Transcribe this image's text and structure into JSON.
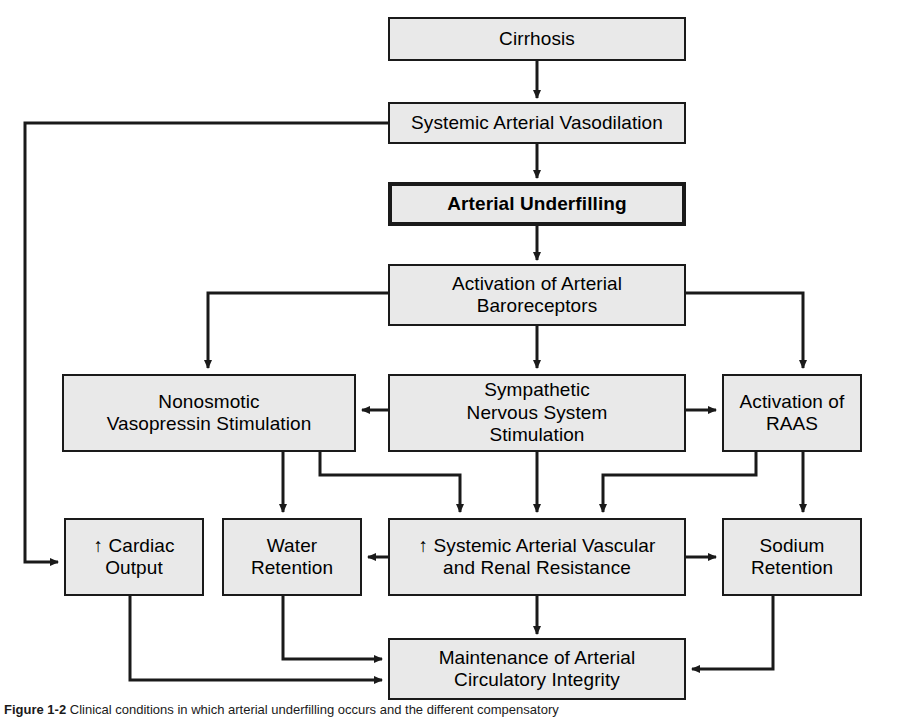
{
  "figure": {
    "caption_number": "Figure 1-2",
    "caption_text": "Clinical conditions in which arterial underfilling occurs and the different compensatory",
    "box_fill": "#e9e9e9",
    "box_stroke": "#1a1a1a",
    "background": "#ffffff"
  },
  "nodes": [
    {
      "id": "cirrhosis",
      "label": "Cirrhosis",
      "x": 388,
      "y": 17,
      "w": 298,
      "h": 44,
      "emphasis": false
    },
    {
      "id": "systemic-arterial-vasodilation",
      "label": "Systemic Arterial Vasodilation",
      "x": 388,
      "y": 102,
      "w": 298,
      "h": 42,
      "emphasis": false
    },
    {
      "id": "arterial-underfilling",
      "label": "Arterial Underfilling",
      "x": 388,
      "y": 182,
      "w": 298,
      "h": 44,
      "emphasis": true
    },
    {
      "id": "activation-of-arterial-baroreceptors",
      "label": "Activation of Arterial\nBaroreceptors",
      "x": 388,
      "y": 264,
      "w": 298,
      "h": 62,
      "emphasis": false
    },
    {
      "id": "nonosmotic-vasopressin-stimulation",
      "label": "Nonosmotic\nVasopressin Stimulation",
      "x": 62,
      "y": 374,
      "w": 294,
      "h": 78,
      "emphasis": false
    },
    {
      "id": "sympathetic-nervous-system-stimulation",
      "label": "Sympathetic\nNervous System\nStimulation",
      "x": 388,
      "y": 374,
      "w": 298,
      "h": 78,
      "emphasis": false
    },
    {
      "id": "activation-of-raas",
      "label": "Activation of\nRAAS",
      "x": 722,
      "y": 374,
      "w": 140,
      "h": 78,
      "emphasis": false
    },
    {
      "id": "cardiac-output",
      "label": "↑ Cardiac\nOutput",
      "x": 64,
      "y": 518,
      "w": 140,
      "h": 78,
      "emphasis": false
    },
    {
      "id": "water-retention",
      "label": "Water\nRetention",
      "x": 222,
      "y": 518,
      "w": 140,
      "h": 78,
      "emphasis": false
    },
    {
      "id": "systemic-arterial-vascular-renal-resistance",
      "label": "↑ Systemic Arterial Vascular\nand Renal Resistance",
      "x": 388,
      "y": 518,
      "w": 298,
      "h": 78,
      "emphasis": false
    },
    {
      "id": "sodium-retention",
      "label": "Sodium\nRetention",
      "x": 722,
      "y": 518,
      "w": 140,
      "h": 78,
      "emphasis": false
    },
    {
      "id": "maintenance-of-arterial-circulatory-integrity",
      "label": "Maintenance of Arterial\nCirculatory Integrity",
      "x": 388,
      "y": 638,
      "w": 298,
      "h": 62,
      "emphasis": false
    }
  ],
  "edges": [
    {
      "id": "cirrhosis-to-vasodilation",
      "from": "cirrhosis",
      "to": "systemic-arterial-vasodilation",
      "points": "537,61 537,98",
      "arrow": true
    },
    {
      "id": "vasodilation-to-underfilling",
      "from": "systemic-arterial-vasodilation",
      "to": "arterial-underfilling",
      "points": "537,144 537,178",
      "arrow": true
    },
    {
      "id": "underfilling-to-baroreceptors",
      "from": "arterial-underfilling",
      "to": "activation-of-arterial-baroreceptors",
      "points": "537,226 537,260",
      "arrow": true
    },
    {
      "id": "vasodilation-to-cardiac-output",
      "from": "systemic-arterial-vasodilation",
      "to": "cardiac-output",
      "points": "388,123 25,123 25,562 58,562",
      "arrow": true
    },
    {
      "id": "baroreceptors-to-nonosmotic",
      "from": "activation-of-arterial-baroreceptors",
      "to": "nonosmotic-vasopressin-stimulation",
      "points": "388,293 208,293 208,368",
      "arrow": true
    },
    {
      "id": "baroreceptors-to-sympathetic",
      "from": "activation-of-arterial-baroreceptors",
      "to": "sympathetic-nervous-system-stimulation",
      "points": "537,326 537,368",
      "arrow": true
    },
    {
      "id": "baroreceptors-to-raas",
      "from": "activation-of-arterial-baroreceptors",
      "to": "activation-of-raas",
      "points": "686,293 803,293 803,368",
      "arrow": true
    },
    {
      "id": "sympathetic-to-nonosmotic",
      "from": "sympathetic-nervous-system-stimulation",
      "to": "nonosmotic-vasopressin-stimulation",
      "points": "388,410 362,410",
      "arrow": true
    },
    {
      "id": "sympathetic-to-raas",
      "from": "sympathetic-nervous-system-stimulation",
      "to": "activation-of-raas",
      "points": "686,410 716,410",
      "arrow": true
    },
    {
      "id": "nonosmotic-to-water-retention",
      "from": "nonosmotic-vasopressin-stimulation",
      "to": "water-retention",
      "points": "283,452 283,512",
      "arrow": true
    },
    {
      "id": "nonosmotic-to-vascular-resistance",
      "from": "nonosmotic-vasopressin-stimulation",
      "to": "systemic-arterial-vascular-renal-resistance",
      "points": "320,452 320,475 460,475 460,512",
      "arrow": true
    },
    {
      "id": "sympathetic-to-vascular-resistance",
      "from": "sympathetic-nervous-system-stimulation",
      "to": "systemic-arterial-vascular-renal-resistance",
      "points": "537,452 537,512",
      "arrow": true
    },
    {
      "id": "raas-to-vascular-resistance",
      "from": "activation-of-raas",
      "to": "systemic-arterial-vascular-renal-resistance",
      "points": "756,452 756,475 603,475 603,512",
      "arrow": true
    },
    {
      "id": "raas-to-sodium-retention",
      "from": "activation-of-raas",
      "to": "sodium-retention",
      "points": "803,452 803,512",
      "arrow": true
    },
    {
      "id": "vascular-resistance-to-water-retention",
      "from": "systemic-arterial-vascular-renal-resistance",
      "to": "water-retention",
      "points": "388,557 368,557",
      "arrow": true
    },
    {
      "id": "vascular-resistance-to-sodium-retention",
      "from": "systemic-arterial-vascular-renal-resistance",
      "to": "sodium-retention",
      "points": "686,557 716,557",
      "arrow": true
    },
    {
      "id": "cardiac-output-to-maintenance",
      "from": "cardiac-output",
      "to": "maintenance-of-arterial-circulatory-integrity",
      "points": "130,596 130,680 382,680",
      "arrow": true
    },
    {
      "id": "water-retention-to-maintenance",
      "from": "water-retention",
      "to": "maintenance-of-arterial-circulatory-integrity",
      "points": "283,596 283,659 382,659",
      "arrow": true
    },
    {
      "id": "vascular-resistance-to-maintenance",
      "from": "systemic-arterial-vascular-renal-resistance",
      "to": "maintenance-of-arterial-circulatory-integrity",
      "points": "537,596 537,634",
      "arrow": true
    },
    {
      "id": "sodium-retention-to-maintenance",
      "from": "sodium-retention",
      "to": "maintenance-of-arterial-circulatory-integrity",
      "points": "773,596 773,669 692,669",
      "arrow": true
    }
  ]
}
